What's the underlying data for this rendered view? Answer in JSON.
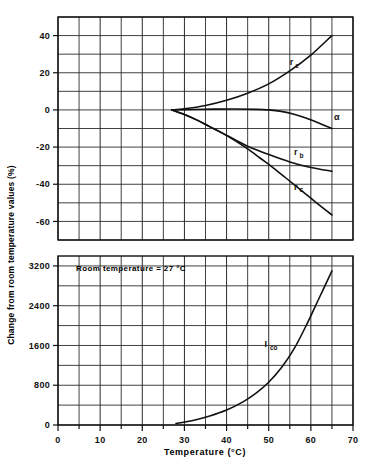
{
  "figure": {
    "background": "#ffffff",
    "ink": "#111111",
    "gridline_color": "#2b2b2b",
    "annotation": "Room  temperature = 27 °C"
  },
  "axis": {
    "x_title": "Temperature  (°C)",
    "y_title": "Change from room temperature values (%)",
    "x_ticks": [
      "0",
      "10",
      "20",
      "30",
      "40",
      "50",
      "60",
      "70"
    ],
    "x_tick_values": [
      0,
      10,
      20,
      30,
      40,
      50,
      60,
      70
    ],
    "x_minor_step": 5,
    "top_y_ticks": [
      "40",
      "20",
      "0",
      "-20",
      "-40",
      "-60"
    ],
    "top_y_tick_values": [
      40,
      20,
      0,
      -20,
      -40,
      -60
    ],
    "bottom_y_ticks": [
      "3200",
      "2400",
      "1600",
      "800",
      "0"
    ],
    "bottom_y_tick_values": [
      3200,
      2400,
      1600,
      800,
      0
    ]
  },
  "chart_data": {
    "type": "line",
    "title": "",
    "subtitle": "",
    "xlabel": "Temperature  (°C)",
    "ylabel": "Change from room temperature values (%)",
    "annotations": [
      {
        "text": "Room  temperature = 27 °C",
        "x": 22,
        "y": 3050,
        "panel": "bottom"
      }
    ],
    "grid": true,
    "legend_position": "inline-curve-labels",
    "panels": [
      {
        "name": "top",
        "ylabel": "Change from room temperature values (%)",
        "xlim": [
          0,
          70
        ],
        "ylim": [
          -70,
          50
        ],
        "y_major_step": 20,
        "y_grid_step": 10,
        "x_grid_step": 5,
        "series": [
          {
            "name": "re",
            "label": "r",
            "sublabel": "e",
            "label_x": 55,
            "label_y": 24,
            "x": [
              27,
              30,
              35,
              40,
              45,
              50,
              55,
              60,
              65
            ],
            "y": [
              0,
              0.6,
              2.4,
              5.2,
              9.0,
              14.0,
              21.0,
              29.5,
              40.0
            ]
          },
          {
            "name": "alpha",
            "label": "α",
            "sublabel": "",
            "label_x": 65.5,
            "label_y": -5.5,
            "x": [
              27,
              32,
              37,
              42,
              47,
              50,
              53,
              56,
              59,
              62,
              65
            ],
            "y": [
              0,
              0.2,
              0.4,
              0.5,
              0.3,
              0.0,
              -0.8,
              -2.3,
              -4.5,
              -7.2,
              -10.0
            ]
          },
          {
            "name": "rb",
            "label": "r",
            "sublabel": "b",
            "label_x": 56,
            "label_y": -24.5,
            "x": [
              27,
              30,
              33,
              36,
              39,
              42,
              45,
              50,
              55,
              60,
              65
            ],
            "y": [
              0,
              -2.5,
              -5.5,
              -9.0,
              -12.5,
              -16.0,
              -19.5,
              -24.0,
              -28.0,
              -31.0,
              -33.0
            ]
          },
          {
            "name": "rc",
            "label": "r",
            "sublabel": "c",
            "label_x": 56,
            "label_y": -43.0,
            "x": [
              27,
              30,
              33,
              36,
              39,
              42,
              45,
              48,
              51,
              54,
              57,
              60,
              63,
              65
            ],
            "y": [
              0,
              -2.5,
              -5.5,
              -9.0,
              -12.5,
              -16.5,
              -21.0,
              -26.0,
              -31.0,
              -36.5,
              -42.0,
              -47.5,
              -53.0,
              -56.5
            ]
          }
        ]
      },
      {
        "name": "bottom",
        "xlim": [
          0,
          70
        ],
        "ylim": [
          0,
          3400
        ],
        "y_major_step": 800,
        "y_grid_step": 400,
        "x_grid_step": 5,
        "series": [
          {
            "name": "Ico",
            "label": "I",
            "sublabel": "co",
            "label_x": 49,
            "label_y": 1560,
            "x": [
              28,
              32,
              36,
              40,
              44,
              47,
              50,
              53,
              56,
              59,
              62,
              65
            ],
            "y": [
              30,
              90,
              180,
              300,
              470,
              640,
              860,
              1150,
              1530,
              2020,
              2560,
              3100
            ]
          }
        ]
      }
    ]
  }
}
